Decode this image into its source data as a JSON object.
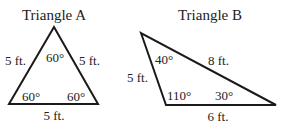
{
  "triangles": [
    {
      "title": "Triangle A",
      "sides": {
        "left": "5 ft.",
        "right": "5 ft.",
        "bottom": "5 ft."
      },
      "angles": {
        "top": "60°",
        "bottom_left": "60°",
        "bottom_right": "60°"
      }
    },
    {
      "title": "Triangle B",
      "sides": {
        "left": "5 ft.",
        "hypotenuse": "8 ft.",
        "bottom": "6 ft."
      },
      "angles": {
        "top": "40°",
        "bottom_left": "110°",
        "bottom_right": "30°"
      }
    }
  ],
  "colors": {
    "stroke": "#1a1a1a",
    "text": "#222222",
    "background": "#ffffff"
  }
}
